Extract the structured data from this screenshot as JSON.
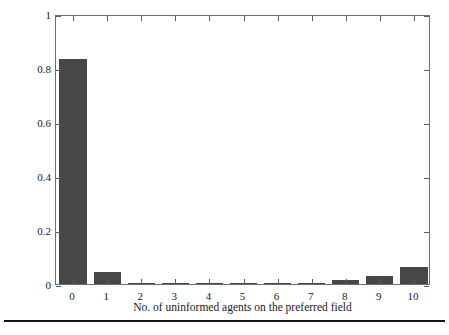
{
  "figure": {
    "background_color": "#ffffff",
    "bar_color": "#474747",
    "axis_color": "#6e6e6e",
    "rule_color": "#141414"
  },
  "chart_data": {
    "type": "bar",
    "title": "",
    "xlabel": "No. of uninformed agents on the preferred field",
    "ylabel": "Probability",
    "categories": [
      "0",
      "1",
      "2",
      "3",
      "4",
      "5",
      "6",
      "7",
      "8",
      "9",
      "10"
    ],
    "values": [
      0.833,
      0.044,
      0.003,
      0.001,
      0.001,
      0.002,
      0.002,
      0.005,
      0.016,
      0.03,
      0.063
    ],
    "xlim": [
      -0.5,
      10.5
    ],
    "ylim": [
      0,
      1
    ],
    "yticks": [
      0,
      0.2,
      0.4,
      0.6,
      0.8,
      1
    ],
    "ytick_labels": [
      "0",
      "0.2",
      "0.4",
      "0.6",
      "0.8",
      "1"
    ],
    "xticks": [
      0,
      1,
      2,
      3,
      4,
      5,
      6,
      7,
      8,
      9,
      10
    ],
    "xtick_labels": [
      "0",
      "1",
      "2",
      "3",
      "4",
      "5",
      "6",
      "7",
      "8",
      "9",
      "10"
    ],
    "grid": false,
    "legend": null,
    "box": true,
    "series": [
      {
        "name": "Probability",
        "values": [
          0.833,
          0.044,
          0.003,
          0.001,
          0.001,
          0.002,
          0.002,
          0.005,
          0.016,
          0.03,
          0.063
        ]
      }
    ]
  }
}
